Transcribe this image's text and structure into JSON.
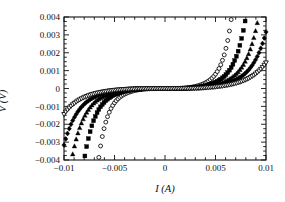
{
  "chart_data": {
    "type": "scatter",
    "title": "",
    "xlabel": "I (A)",
    "ylabel": "V (V)",
    "xlim": [
      -0.01,
      0.01
    ],
    "ylim": [
      -0.004,
      0.004
    ],
    "xticks": [
      -0.01,
      -0.005,
      0,
      0.005,
      0.01
    ],
    "xticklabels": [
      "-0.01",
      "-0.005",
      "0",
      "0.005",
      "0.01"
    ],
    "yticks": [
      -0.004,
      -0.003,
      -0.002,
      -0.001,
      0,
      0.001,
      0.002,
      0.003,
      0.004
    ],
    "yticklabels": [
      "-0.004",
      "-0.003",
      "-0.002",
      "-0.001",
      "0",
      "0.001",
      "0.002",
      "0.003",
      "0.004"
    ],
    "minor_ticks": true,
    "grid": false,
    "legend": null,
    "frame": true,
    "series": [
      {
        "name": "series-1",
        "marker": "open-circle",
        "filled": false,
        "color": "#000000",
        "Ic": 0.0042,
        "n": 9,
        "Vc": 4.5e-05,
        "Rn": 0.42,
        "points_x": [
          -0.01,
          -0.0097,
          -0.0094,
          -0.0091,
          -0.0088,
          -0.0085,
          -0.0082,
          -0.0079,
          -0.0076,
          -0.0073,
          -0.007,
          -0.0067,
          -0.0064,
          -0.0061,
          -0.0058,
          -0.0055,
          -0.0052,
          -0.0049,
          -0.0046,
          -0.0043,
          -0.004,
          -0.0035,
          -0.003,
          -0.0025,
          -0.002,
          -0.0015,
          -0.001,
          -0.0005,
          0.0,
          0.0005,
          0.001,
          0.0015,
          0.002,
          0.0025,
          0.003,
          0.0035,
          0.004,
          0.0043,
          0.0046,
          0.0049,
          0.0052,
          0.0055,
          0.0058,
          0.0061,
          0.0064,
          0.0067,
          0.007,
          0.0073,
          0.0076,
          0.0079,
          0.0082,
          0.0085,
          0.0088,
          0.0091,
          0.0094,
          0.0097,
          0.01
        ]
      },
      {
        "name": "series-2",
        "marker": "filled-square",
        "filled": true,
        "color": "#000000",
        "Ic": 0.0051,
        "n": 9,
        "Vc": 4.5e-05,
        "Rn": 0.42
      },
      {
        "name": "series-3",
        "marker": "filled-triangle",
        "filled": true,
        "color": "#000000",
        "Ic": 0.0059,
        "n": 9,
        "Vc": 4.5e-05,
        "Rn": 0.42
      },
      {
        "name": "series-4",
        "marker": "filled-diamond",
        "filled": true,
        "color": "#000000",
        "Ic": 0.0066,
        "n": 9,
        "Vc": 4.5e-05,
        "Rn": 0.42
      },
      {
        "name": "series-5",
        "marker": "open-triangle-down",
        "filled": false,
        "color": "#000000",
        "Ic": 0.0075,
        "n": 9,
        "Vc": 4.5e-05,
        "Rn": 0.42
      }
    ]
  },
  "axes": {
    "x_title": "I (A)",
    "y_title": "V (V)"
  },
  "style": {
    "background": "#ffffff",
    "axis_color": "#111111",
    "marker_color": "#000000"
  }
}
